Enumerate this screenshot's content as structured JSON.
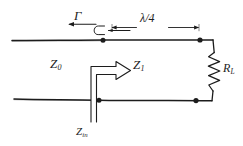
{
  "figure": {
    "type": "circuit-diagram",
    "width": 243,
    "height": 146,
    "background_color": "#ffffff",
    "ink_color": "#1c1c1c"
  },
  "labels": {
    "reflection_coefficient": "Γ",
    "length": "λ/4",
    "source_impedance": "Z",
    "source_impedance_sub": "0",
    "section_impedance": "Z",
    "section_impedance_sub": "1",
    "load_resistance": "R",
    "load_resistance_sub": "L",
    "input_impedance": "Z",
    "input_impedance_sub": "in"
  },
  "elements": {
    "top_conductor": "top-transmission-line",
    "bottom_conductor": "bottom-transmission-line",
    "load": "load-resistor-zigzag",
    "nodes": [
      {
        "name": "top-left-node",
        "x": 103,
        "y": 40
      },
      {
        "name": "top-right-node",
        "x": 200,
        "y": 40
      },
      {
        "name": "bottom-left-node",
        "x": 99,
        "y": 100
      },
      {
        "name": "bottom-right-node",
        "x": 196,
        "y": 100
      }
    ],
    "arrows": [
      {
        "name": "gamma-reflection-arrow",
        "direction": "left",
        "style": "u-turn"
      },
      {
        "name": "lambda-dimension-arrow",
        "direction": "both",
        "style": "dimension"
      },
      {
        "name": "zin-arrow",
        "direction": "right",
        "style": "hollow-block"
      }
    ]
  }
}
